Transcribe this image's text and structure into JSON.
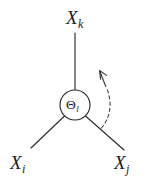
{
  "figure": {
    "background_color": "#ffffff",
    "stroke_color": "#2b2b2b",
    "dash_color": "#4a4a4a",
    "width": 151,
    "height": 182
  },
  "center_node": {
    "name": "theta-node",
    "symbol": "Θ",
    "subscript": "l",
    "shape": "circle",
    "cx": 75,
    "cy": 105,
    "r": 15
  },
  "variables": [
    {
      "id": "xk",
      "symbol": "X",
      "subscript": "k",
      "position": "top",
      "label_x": 66,
      "label_y": 8
    },
    {
      "id": "xi",
      "symbol": "X",
      "subscript": "i",
      "position": "bottom-left",
      "label_x": 10,
      "label_y": 153
    },
    {
      "id": "xj",
      "symbol": "X",
      "subscript": "j",
      "position": "bottom-right",
      "label_x": 114,
      "label_y": 153
    }
  ],
  "edges": [
    {
      "id": "edge-theta-xk",
      "from": "theta-node",
      "to": "xk",
      "style": "solid"
    },
    {
      "id": "edge-theta-xi",
      "from": "theta-node",
      "to": "xi",
      "style": "solid"
    },
    {
      "id": "edge-theta-xj",
      "from": "theta-node",
      "to": "xj",
      "style": "solid"
    }
  ],
  "rotation_arrow": {
    "id": "rotation-arrow",
    "style": "dashed",
    "direction": "counterclockwise",
    "arrowhead": "up-left",
    "description": "dashed curved arrow sweeping counterclockwise on the right side"
  }
}
